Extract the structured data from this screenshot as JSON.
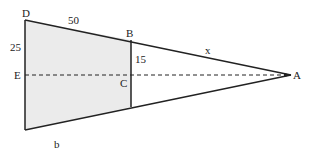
{
  "diagram": {
    "type": "similar-triangles-trapezoid",
    "fill_color": "#ebebeb",
    "stroke_color": "#222222",
    "points": {
      "D": {
        "label": "D",
        "x": 25,
        "y": 20
      },
      "B": {
        "label": "B",
        "x": 131,
        "y": 40
      },
      "C": {
        "label": "C",
        "x": 131,
        "y": 75
      },
      "E": {
        "label": "E",
        "x": 25,
        "y": 75
      },
      "A": {
        "label": "A",
        "x": 291,
        "y": 75
      },
      "bottom_right": {
        "x": 131,
        "y": 107
      },
      "bottom_left": {
        "x": 25,
        "y": 130
      }
    },
    "measurements": {
      "DB": "50",
      "DE": "25",
      "BC": "15",
      "BA": "x",
      "bottom": "b"
    }
  }
}
